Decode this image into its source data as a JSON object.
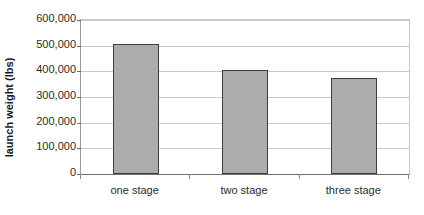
{
  "chart_data": {
    "type": "bar",
    "title": "",
    "xlabel": "",
    "ylabel": "launch weight (lbs)",
    "categories": [
      "one stage",
      "two stage",
      "three stage"
    ],
    "values": [
      505000,
      407000,
      375000
    ],
    "ylim": [
      0,
      600000
    ],
    "ytick_values": [
      0,
      100000,
      200000,
      300000,
      400000,
      500000,
      600000
    ],
    "ytick_labels": [
      "0",
      "100,000",
      "200,000",
      "300,000",
      "400,000",
      "500,000",
      "600,000"
    ],
    "grid": true,
    "legend": false,
    "bar_color": "#acacac",
    "bar_border_color": "#3d3d3d",
    "gridline_color": "#c9c9c9",
    "axis_color": "#6e6e6e",
    "background": "#ffffff"
  }
}
